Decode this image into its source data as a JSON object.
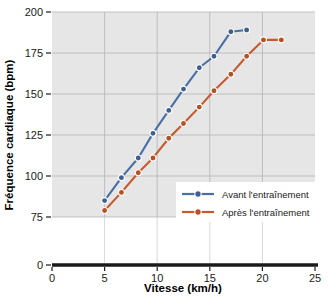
{
  "chart_data": {
    "type": "line",
    "title": "",
    "xlabel": "Vitesse (km/h)",
    "ylabel": "Fréquence cardiaque (bpm)",
    "xlim": [
      0,
      25
    ],
    "ylim": [
      75,
      200
    ],
    "y_axis_broken": true,
    "y_break_from": 0,
    "y_break_to": 75,
    "grid": true,
    "legend_position": "lower right",
    "xticks": [
      0,
      5,
      10,
      15,
      20,
      25
    ],
    "xtick_labels": [
      "0",
      "5",
      "10",
      "15",
      "20",
      "25"
    ],
    "yticks": [
      0,
      75,
      100,
      125,
      150,
      175,
      200
    ],
    "ytick_labels": [
      "0",
      "75",
      "100",
      "125",
      "150",
      "175",
      "200"
    ],
    "series": [
      {
        "name": "Avant l'entraînement",
        "color": "#4A6FA5",
        "marker": "circle",
        "x": [
          5.0,
          6.6,
          8.2,
          9.6,
          11.1,
          12.5,
          14.0,
          15.4,
          17.0,
          18.5
        ],
        "y": [
          85,
          99,
          111,
          126,
          140,
          153,
          166,
          173,
          188,
          189
        ]
      },
      {
        "name": "Après l'entraînement",
        "color": "#C65A2E",
        "marker": "circle",
        "x": [
          5.0,
          6.6,
          8.2,
          9.6,
          11.1,
          12.5,
          14.0,
          15.4,
          17.0,
          18.5,
          20.1,
          21.8
        ],
        "y": [
          79,
          90,
          102,
          111,
          123,
          132,
          142,
          152,
          162,
          173,
          183,
          183
        ]
      }
    ]
  },
  "axes": {
    "x_title": "Vitesse (km/h)",
    "y_title": "Fréquence cardiaque (bpm)",
    "x_tick_0": "0",
    "x_tick_1": "5",
    "x_tick_2": "10",
    "x_tick_3": "15",
    "x_tick_4": "20",
    "x_tick_5": "25",
    "y_tick_0": "0",
    "y_tick_75": "75",
    "y_tick_100": "100",
    "y_tick_125": "125",
    "y_tick_150": "150",
    "y_tick_175": "175",
    "y_tick_200": "200"
  },
  "legend": {
    "entries": [
      {
        "label": "Avant l'entraînement",
        "color": "#4A6FA5"
      },
      {
        "label": "Après l'entraînement",
        "color": "#C65A2E"
      }
    ]
  },
  "colors": {
    "series_before": "#4A6FA5",
    "series_after": "#C65A2E",
    "plot_background": "#e6e6e6",
    "grid": "#b4b4b4",
    "axis": "#1a1a1a"
  }
}
